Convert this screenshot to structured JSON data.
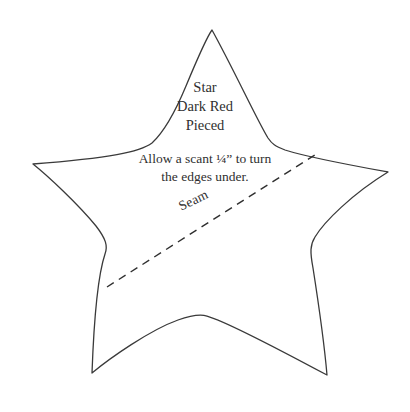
{
  "document": {
    "type": "quilt-pattern-template",
    "shape_name": "star",
    "background_color": "#ffffff",
    "ink_color": "#2f2f2f"
  },
  "fabric_label": {
    "lines": [
      "Star",
      "Dark Red",
      "Pieced"
    ],
    "line_1": "Star",
    "line_2": "Dark Red",
    "line_3": "Pieced"
  },
  "seam_allowance_note": {
    "line_1": "Allow a scant ¼” to turn",
    "line_2": "the edges under."
  },
  "seam_line": {
    "label": "Seam",
    "style": "dashed",
    "rotation_degrees": -25.5,
    "start_point": [
      107,
      287
    ],
    "end_point": [
      318,
      153
    ],
    "color": "#2f2f2f"
  },
  "star_outline": {
    "stroke_color": "#3a3a3a",
    "stroke_width": 1.3,
    "fill": "none",
    "points": 5,
    "tips": {
      "top": [
        212,
        30
      ],
      "left": [
        33,
        164
      ],
      "right": [
        388,
        172
      ],
      "bottom_left": [
        92,
        373
      ],
      "bottom_right": [
        327,
        375
      ]
    },
    "valleys": {
      "upper_left": [
        152,
        143
      ],
      "upper_right": [
        272,
        142
      ],
      "inner_left": [
        105,
        250
      ],
      "inner_right": [
        313,
        250
      ],
      "bottom": [
        207,
        316
      ]
    }
  }
}
